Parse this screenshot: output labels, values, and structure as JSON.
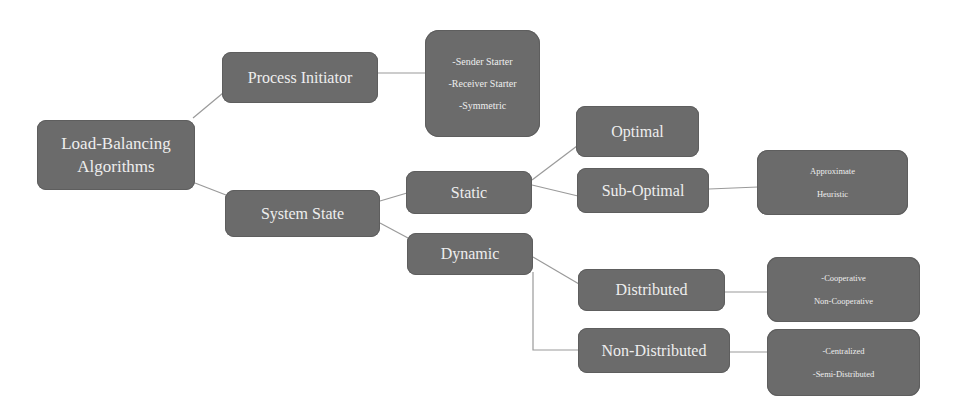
{
  "diagram": {
    "type": "tree",
    "colors": {
      "node_fill": "#6b6b6b",
      "node_text": "#eeeeee",
      "connector": "#9a9a9a",
      "background": "#ffffff"
    },
    "root": {
      "label_line1": "Load-Balancing",
      "label_line2": "Algorithms"
    },
    "process_initiator": {
      "label": "Process Initiator",
      "items": [
        "-Sender Starter",
        "-Receiver Starter",
        "-Symmetric"
      ]
    },
    "system_state": {
      "label": "System State",
      "static": {
        "label": "Static",
        "optimal": {
          "label": "Optimal"
        },
        "sub_optimal": {
          "label": "Sub-Optimal",
          "items": [
            "Approximate",
            "Heuristic"
          ]
        }
      },
      "dynamic": {
        "label": "Dynamic",
        "distributed": {
          "label": "Distributed",
          "items": [
            "-Cooperative",
            "Non-Cooperative"
          ]
        },
        "non_distributed": {
          "label": "Non-Distributed",
          "items": [
            "-Centralized",
            "-Semi-Distributed"
          ]
        }
      }
    },
    "edges": [
      [
        "Load-Balancing Algorithms",
        "Process Initiator"
      ],
      [
        "Load-Balancing Algorithms",
        "System State"
      ],
      [
        "Process Initiator",
        "Initiator types"
      ],
      [
        "System State",
        "Static"
      ],
      [
        "System State",
        "Dynamic"
      ],
      [
        "Static",
        "Optimal"
      ],
      [
        "Static",
        "Sub-Optimal"
      ],
      [
        "Sub-Optimal",
        "Sub-Optimal types"
      ],
      [
        "Dynamic",
        "Distributed"
      ],
      [
        "Dynamic",
        "Non-Distributed"
      ],
      [
        "Distributed",
        "Distributed types"
      ],
      [
        "Non-Distributed",
        "Non-Distributed types"
      ]
    ]
  }
}
